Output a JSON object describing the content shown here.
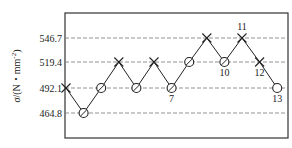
{
  "chart_data": {
    "type": "line",
    "title": "",
    "xlabel": "",
    "ylabel": "σ/(N・mm⁻²)",
    "ylabel_parts": {
      "sigma": "σ",
      "rest": "/(N・mm",
      "sup": "-2",
      "close": ")"
    },
    "yticks": [
      "546.7",
      "519.4",
      "492.1",
      "464.8"
    ],
    "ytick_values": [
      546.7,
      519.4,
      492.1,
      464.8
    ],
    "grid": "horizontal dashed",
    "x": [
      1,
      2,
      3,
      4,
      5,
      6,
      7,
      8,
      9,
      10,
      11,
      12,
      13
    ],
    "values": [
      492.1,
      464.8,
      492.1,
      519.4,
      492.1,
      519.4,
      492.1,
      519.4,
      546.7,
      519.4,
      546.7,
      519.4,
      492.1
    ],
    "markers": [
      "x",
      "o",
      "o",
      "x",
      "o",
      "x",
      "o",
      "o",
      "x",
      "o",
      "x",
      "x",
      "o"
    ],
    "point_labels": {
      "7": "7",
      "10": "10",
      "11": "11",
      "12": "12",
      "13": "13"
    },
    "legend": "x = failure, o = run-out"
  }
}
